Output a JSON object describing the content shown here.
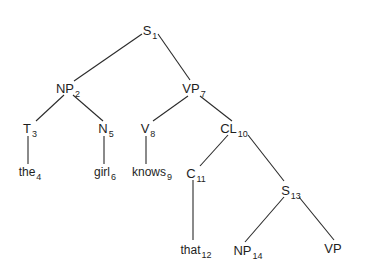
{
  "diagram": {
    "type": "parse-tree",
    "nodes": [
      {
        "id": "S1",
        "label": "S",
        "sub": "1",
        "x": 150,
        "y": 30
      },
      {
        "id": "NP2",
        "label": "NP",
        "sub": "2",
        "x": 68,
        "y": 88
      },
      {
        "id": "VP7",
        "label": "VP",
        "sub": "7",
        "x": 194,
        "y": 88
      },
      {
        "id": "T3",
        "label": "T",
        "sub": "3",
        "x": 30,
        "y": 128
      },
      {
        "id": "N5",
        "label": "N",
        "sub": "5",
        "x": 106,
        "y": 128
      },
      {
        "id": "V8",
        "label": "V",
        "sub": "8",
        "x": 148,
        "y": 128
      },
      {
        "id": "CL10",
        "label": "CL",
        "sub": "10",
        "x": 234,
        "y": 128
      },
      {
        "id": "the4",
        "label": "the",
        "sub": "4",
        "x": 30,
        "y": 172,
        "word": true
      },
      {
        "id": "girl6",
        "label": "girl",
        "sub": "6",
        "x": 105,
        "y": 172,
        "word": true
      },
      {
        "id": "knows9",
        "label": "knows",
        "sub": "9",
        "x": 152,
        "y": 172,
        "word": true
      },
      {
        "id": "C11",
        "label": "C",
        "sub": "11",
        "x": 196,
        "y": 173
      },
      {
        "id": "S13",
        "label": "S",
        "sub": "13",
        "x": 291,
        "y": 190
      },
      {
        "id": "that12",
        "label": "that",
        "sub": "12",
        "x": 196,
        "y": 250,
        "word": true
      },
      {
        "id": "NP14",
        "label": "NP",
        "sub": "14",
        "x": 248,
        "y": 250
      },
      {
        "id": "VP",
        "label": "VP",
        "sub": "",
        "x": 333,
        "y": 248
      }
    ],
    "edges": [
      {
        "from": [
          142,
          34
        ],
        "to": [
          74,
          81
        ]
      },
      {
        "from": [
          158,
          34
        ],
        "to": [
          190,
          80
        ]
      },
      {
        "from": [
          64,
          95
        ],
        "to": [
          36,
          121
        ]
      },
      {
        "from": [
          73,
          95
        ],
        "to": [
          103,
          121
        ]
      },
      {
        "from": [
          188,
          96
        ],
        "to": [
          153,
          121
        ]
      },
      {
        "from": [
          200,
          96
        ],
        "to": [
          232,
          121
        ]
      },
      {
        "from": [
          28,
          136
        ],
        "to": [
          28,
          164
        ]
      },
      {
        "from": [
          104,
          136
        ],
        "to": [
          104,
          164
        ]
      },
      {
        "from": [
          146,
          136
        ],
        "to": [
          146,
          164
        ]
      },
      {
        "from": [
          228,
          135
        ],
        "to": [
          200,
          166
        ]
      },
      {
        "from": [
          248,
          135
        ],
        "to": [
          284,
          181
        ]
      },
      {
        "from": [
          193,
          180
        ],
        "to": [
          193,
          240
        ]
      },
      {
        "from": [
          284,
          197
        ],
        "to": [
          245,
          242
        ]
      },
      {
        "from": [
          299,
          197
        ],
        "to": [
          334,
          240
        ]
      }
    ]
  }
}
